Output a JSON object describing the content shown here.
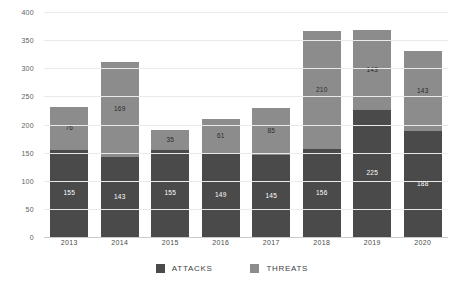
{
  "chart_data": {
    "type": "bar",
    "stacked": true,
    "title": "",
    "xlabel": "",
    "ylabel": "",
    "categories": [
      "2013",
      "2014",
      "2015",
      "2016",
      "2017",
      "2018",
      "2019",
      "2020"
    ],
    "series": [
      {
        "name": "ATTACKS",
        "color": "#4a4a4a",
        "values": [
          155,
          143,
          155,
          149,
          145,
          156,
          225,
          188
        ]
      },
      {
        "name": "THREATS",
        "color": "#8c8c8c",
        "values": [
          76,
          169,
          35,
          61,
          85,
          210,
          143,
          143
        ]
      }
    ],
    "totals": [
      231,
      312,
      190,
      210,
      230,
      366,
      368,
      331
    ],
    "ylim": [
      0,
      400
    ],
    "yticks": [
      "0",
      "50",
      "100",
      "150",
      "200",
      "250",
      "300",
      "350",
      "400"
    ],
    "ytick_values": [
      0,
      50,
      100,
      150,
      200,
      250,
      300,
      350,
      400
    ],
    "grid": true,
    "legend_position": "bottom"
  },
  "legend": {
    "items": [
      {
        "label": "ATTACKS",
        "color": "#4a4a4a"
      },
      {
        "label": "THREATS",
        "color": "#8c8c8c"
      }
    ]
  },
  "colors": {
    "attacks": "#4a4a4a",
    "threats": "#8c8c8c",
    "gridline": "#e9e9e9",
    "baseline": "#c9c9c9",
    "background": "#ffffff"
  }
}
